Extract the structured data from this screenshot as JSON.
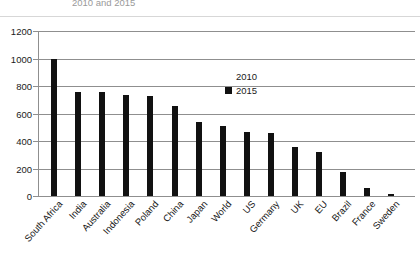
{
  "chart_data": {
    "type": "bar",
    "title": "2010 and 2015",
    "xlabel": "",
    "ylabel": "",
    "ylim": [
      0,
      1200
    ],
    "yticks": [
      0,
      200,
      400,
      600,
      800,
      1000,
      1200
    ],
    "grid": true,
    "legend_position": "inside-top-right",
    "categories": [
      "South Africa",
      "India",
      "Australia",
      "Indonesia",
      "Poland",
      "China",
      "Japan",
      "World",
      "US",
      "Germany",
      "UK",
      "EU",
      "Brazil",
      "France",
      "Sweden"
    ],
    "series": [
      {
        "name": "2010",
        "color": "#ffffff",
        "values": [
          null,
          null,
          null,
          null,
          null,
          null,
          null,
          null,
          null,
          null,
          null,
          null,
          null,
          null,
          null
        ]
      },
      {
        "name": "2015",
        "color": "#111111",
        "values": [
          995,
          760,
          755,
          735,
          730,
          655,
          540,
          510,
          465,
          455,
          355,
          320,
          175,
          55,
          15
        ]
      }
    ]
  },
  "legend": {
    "entries": [
      {
        "label": "2010",
        "swatch": "#ffffff"
      },
      {
        "label": "2015",
        "swatch": "#111111"
      }
    ]
  },
  "axis": {
    "y_tick_labels": [
      "1200",
      "1000",
      "800",
      "600",
      "400",
      "200",
      "0"
    ]
  }
}
